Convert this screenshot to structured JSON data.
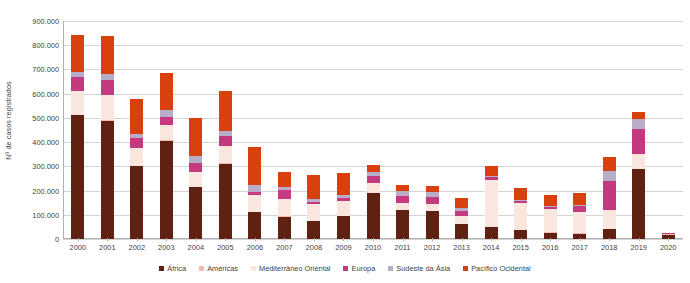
{
  "chart_data": {
    "type": "bar",
    "stacked": true,
    "title": "",
    "xlabel": "",
    "ylabel": "Nº de casos registrados",
    "ylim": [
      0,
      900000
    ],
    "ytick_values": [
      0,
      100000,
      200000,
      300000,
      400000,
      500000,
      600000,
      700000,
      800000,
      900000
    ],
    "ytick_labels": [
      "0",
      "100.000",
      "200.000",
      "300.000",
      "400.000",
      "500.000",
      "600.000",
      "700.000",
      "800.000",
      "900.000"
    ],
    "grid": true,
    "legend_position": "bottom",
    "categories": [
      "2000",
      "2001",
      "2002",
      "2003",
      "2004",
      "2005",
      "2006",
      "2007",
      "2008",
      "2009",
      "2010",
      "2011",
      "2012",
      "2013",
      "2014",
      "2015",
      "2016",
      "2017",
      "2018",
      "2019",
      "2020"
    ],
    "series": [
      {
        "name": "África",
        "color": "#5E2112",
        "values": [
          510000,
          487000,
          300000,
          405000,
          213000,
          310000,
          110000,
          92000,
          74000,
          96000,
          190000,
          118000,
          115000,
          62000,
          50000,
          38000,
          26000,
          22000,
          42000,
          288000,
          18000
        ]
      },
      {
        "name": "Américas",
        "color": "#F4B9AC",
        "values": [
          3000,
          3000,
          2000,
          2000,
          2000,
          2000,
          1000,
          1000,
          1000,
          1000,
          1000,
          1000,
          1000,
          1000,
          1000,
          1000,
          1000,
          1000,
          1000,
          2000,
          1000
        ]
      },
      {
        "name": "Mediterrâneo Oriental",
        "color": "#F8E6DF",
        "values": [
          100000,
          105000,
          75000,
          65000,
          62000,
          73000,
          70000,
          72000,
          68000,
          62000,
          40000,
          30000,
          28000,
          32000,
          192000,
          108000,
          98000,
          88000,
          78000,
          62000,
          3000
        ]
      },
      {
        "name": "Europa",
        "color": "#C5397E",
        "values": [
          56000,
          60000,
          42000,
          30000,
          38000,
          40000,
          12000,
          38000,
          10000,
          9000,
          30000,
          30000,
          28000,
          22000,
          12000,
          8000,
          8000,
          24000,
          117000,
          104000,
          2000
        ]
      },
      {
        "name": "Sudeste da Ásia",
        "color": "#B7ADC9",
        "values": [
          22000,
          28000,
          16000,
          32000,
          28000,
          22000,
          28000,
          12000,
          12000,
          12000,
          14000,
          20000,
          22000,
          12000,
          6000,
          6000,
          5000,
          6000,
          42000,
          38000,
          1000
        ]
      },
      {
        "name": "Pacífico Ocidental",
        "color": "#D8400D",
        "values": [
          150000,
          155000,
          143000,
          153000,
          155000,
          165000,
          160000,
          62000,
          100000,
          92000,
          32000,
          24000,
          26000,
          42000,
          40000,
          50000,
          45000,
          48000,
          60000,
          32000,
          1000
        ]
      }
    ]
  }
}
